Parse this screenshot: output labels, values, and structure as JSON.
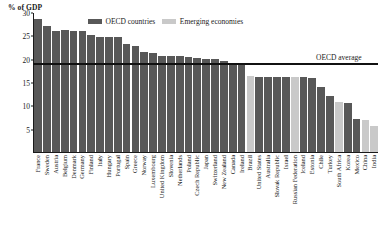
{
  "chart_data": {
    "type": "bar",
    "title": "",
    "ylabel": "% of GDP",
    "xlabel": "",
    "ylim": [
      0,
      30
    ],
    "yticks": [
      30,
      25,
      20,
      15,
      10,
      5
    ],
    "grid": false,
    "legend_position": "top-center",
    "legend": [
      {
        "name": "OECD countries",
        "color": "#585858"
      },
      {
        "name": "Emerging economies",
        "color": "#c9c9c9"
      }
    ],
    "annotations": [
      {
        "label": "OECD average",
        "value": 19.2,
        "type": "hline"
      }
    ],
    "categories": [
      "France",
      "Sweden",
      "Austria",
      "Belgium",
      "Denmark",
      "Germany",
      "Finland",
      "Italy",
      "Hungary",
      "Portugal",
      "Spain",
      "Greece",
      "Norway",
      "Luxembourg",
      "United Kingdom",
      "Slovenia",
      "Netherlands",
      "Poland",
      "Czech Republic",
      "Japan",
      "Switzerland",
      "New Zealand",
      "Canada",
      "Ireland",
      "Brazil",
      "United States",
      "Australia",
      "Slovak Republic",
      "Israel",
      "Russian Federation",
      "Iceland",
      "Estonia",
      "Chile",
      "Turkey",
      "South Africa",
      "Korea",
      "Mexico",
      "China",
      "India"
    ],
    "values": [
      28.7,
      27.2,
      26.2,
      26.3,
      26.2,
      26.2,
      25.2,
      24.9,
      24.9,
      24.9,
      23.2,
      22.8,
      21.6,
      21.3,
      20.6,
      20.7,
      20.6,
      20.5,
      20.2,
      20.1,
      20.1,
      19.7,
      19.2,
      19.0,
      16.3,
      16.2,
      16.2,
      16.1,
      16.1,
      16.1,
      16.1,
      16.0,
      14.0,
      12.0,
      10.8,
      10.5,
      7.0,
      6.9,
      5.5
    ],
    "series_group": [
      "oecd",
      "oecd",
      "oecd",
      "oecd",
      "oecd",
      "oecd",
      "oecd",
      "oecd",
      "oecd",
      "oecd",
      "oecd",
      "oecd",
      "oecd",
      "oecd",
      "oecd",
      "oecd",
      "oecd",
      "oecd",
      "oecd",
      "oecd",
      "oecd",
      "oecd",
      "oecd",
      "oecd",
      "emerging",
      "oecd",
      "oecd",
      "oecd",
      "oecd",
      "emerging",
      "oecd",
      "oecd",
      "oecd",
      "oecd",
      "emerging",
      "oecd",
      "oecd",
      "emerging",
      "emerging"
    ]
  }
}
